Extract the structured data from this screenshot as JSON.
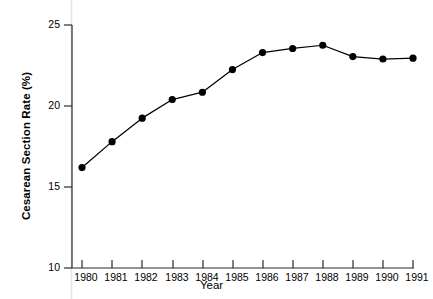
{
  "chart_data": {
    "type": "line",
    "title": "",
    "xlabel": "Year",
    "ylabel": "Cesarean Section Rate (%)",
    "categories": [
      "1980",
      "1981",
      "1982",
      "1983",
      "1984",
      "1985",
      "1986",
      "1987",
      "1988",
      "1989",
      "1990",
      "1991"
    ],
    "x": [
      1980,
      1981,
      1982,
      1983,
      1984,
      1985,
      1986,
      1987,
      1988,
      1989,
      1990,
      1991
    ],
    "values": [
      16.2,
      17.8,
      19.25,
      20.4,
      20.85,
      22.25,
      23.3,
      23.55,
      23.75,
      23.05,
      22.9,
      22.95
    ],
    "xlim": [
      1979.6,
      1991.4
    ],
    "ylim": [
      10,
      25
    ],
    "yticks": [
      10,
      15,
      20,
      25
    ],
    "ytick_labels": [
      "10",
      "15",
      "20",
      "25"
    ],
    "xticks": [
      1980,
      1981,
      1982,
      1983,
      1984,
      1985,
      1986,
      1987,
      1988,
      1989,
      1990,
      1991
    ],
    "xtick_labels": [
      "1980",
      "1981",
      "1982",
      "1983",
      "1984",
      "1985",
      "1986",
      "1987",
      "1988",
      "1989",
      "1990",
      "1991"
    ],
    "grid": false,
    "legend": null,
    "legend_position": "none",
    "series": [
      {
        "name": "Cesarean Section Rate",
        "marker": "filled-circle",
        "color": "#000000",
        "values": [
          16.2,
          17.8,
          19.25,
          20.4,
          20.85,
          22.25,
          23.3,
          23.55,
          23.75,
          23.05,
          22.9,
          22.95
        ]
      }
    ],
    "colors": {
      "line": "#000000",
      "marker": "#000000",
      "axis": "#222222",
      "background": "#ffffff",
      "guide_line": "#e3e3e8"
    }
  }
}
